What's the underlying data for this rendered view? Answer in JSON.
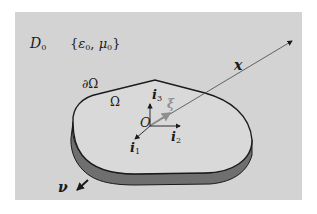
{
  "diagram": {
    "title": "",
    "domain_label": {
      "symbol": "D",
      "subscript": "0"
    },
    "material_params": "{ε₀, μ₀}",
    "material_params_parts": {
      "open": "{",
      "eps": "ε",
      "eps_sub": "0",
      "sep": ", ",
      "mu": "μ",
      "mu_sub": "0",
      "close": "}"
    },
    "boundary_label": "∂Ω",
    "body_label": "Ω",
    "origin_label": "O",
    "basis_vectors": [
      {
        "name": "i1",
        "symbol": "i",
        "subscript": "1",
        "direction": "down-left"
      },
      {
        "name": "i2",
        "symbol": "i",
        "subscript": "2",
        "direction": "right"
      },
      {
        "name": "i3",
        "symbol": "i",
        "subscript": "3",
        "direction": "up"
      }
    ],
    "source_point_vector": {
      "symbol": "ξ",
      "color": "#8f8f8f"
    },
    "observation_vector": {
      "symbol": "x"
    },
    "normal_vector": {
      "symbol": "ν"
    },
    "colors": {
      "background": "#d3d3d3",
      "body_top": "#d9d9d9",
      "body_side": "#6f6f6f",
      "outline": "#1a1a1a",
      "xi_arrow": "#8f8f8f"
    }
  }
}
